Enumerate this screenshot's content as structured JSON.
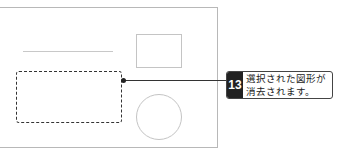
{
  "canvas": {
    "shapes": [
      {
        "type": "line",
        "selected": false
      },
      {
        "type": "rectangle-small",
        "selected": false
      },
      {
        "type": "rectangle",
        "selected": true
      },
      {
        "type": "circle",
        "selected": false
      }
    ]
  },
  "callout": {
    "step_number": "13",
    "line1": "選択された図形が",
    "line2": "消去されます。"
  },
  "colors": {
    "badge_bg": "#222222",
    "selection_border": "#333333",
    "shape_border": "#c4c4c4"
  }
}
